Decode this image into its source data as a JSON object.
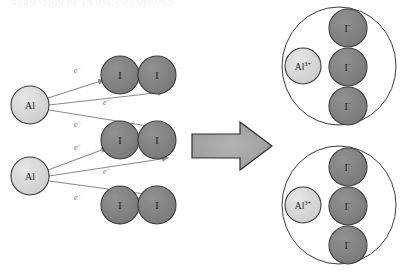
{
  "figure": {
    "title_fragment": "FORMATION OF AN IONIC COMPOUND",
    "reaction_summary": "2 Al + 3 I2 -> 2 AlI3",
    "colors": {
      "aluminum_atom_fill": "#d4d4d4",
      "aluminum_ion_fill": "#dcdcdc",
      "iodine_atom_fill": "#808080",
      "iodide_ion_fill": "#7f7f7f",
      "outline": "#3a3a3a",
      "arrow_fill": "#a8a8a8",
      "arrow_outline": "#2e2e2e",
      "electron_arrow": "#8a8a8a",
      "background": "#ffffff"
    }
  },
  "reactants": {
    "metal_atoms": [
      {
        "label": "Al",
        "cx": 30,
        "cy": 105,
        "r": 19
      },
      {
        "label": "Al",
        "cx": 30,
        "cy": 176,
        "r": 19
      }
    ],
    "halogen_molecules": [
      {
        "name": "iodine-molecule-top",
        "atoms": [
          {
            "label": "I",
            "cx": 120,
            "cy": 75,
            "r": 19
          },
          {
            "label": "I",
            "cx": 157,
            "cy": 75,
            "r": 19
          }
        ]
      },
      {
        "name": "iodine-molecule-middle",
        "atoms": [
          {
            "label": "I",
            "cx": 120,
            "cy": 140,
            "r": 19
          },
          {
            "label": "I",
            "cx": 157,
            "cy": 140,
            "r": 19
          }
        ]
      },
      {
        "name": "iodine-molecule-bottom",
        "atoms": [
          {
            "label": "I",
            "cx": 120,
            "cy": 205,
            "r": 19
          },
          {
            "label": "I",
            "cx": 157,
            "cy": 205,
            "r": 19
          }
        ]
      }
    ]
  },
  "electron_transfers": [
    {
      "label": "e",
      "charge": "−",
      "label_x": 74,
      "label_y": 73,
      "x1": 48,
      "y1": 98,
      "x2": 104,
      "y2": 80
    },
    {
      "label": "e",
      "charge": "−",
      "label_x": 103,
      "label_y": 105,
      "x1": 49,
      "y1": 105,
      "x2": 164,
      "y2": 92
    },
    {
      "label": "e",
      "charge": "−",
      "label_x": 74,
      "label_y": 127,
      "x1": 49,
      "y1": 110,
      "x2": 160,
      "y2": 128
    },
    {
      "label": "e",
      "charge": "−",
      "label_x": 74,
      "label_y": 150,
      "x1": 48,
      "y1": 170,
      "x2": 107,
      "y2": 148
    },
    {
      "label": "e",
      "charge": "−",
      "label_x": 103,
      "label_y": 174,
      "x1": 49,
      "y1": 176,
      "x2": 168,
      "y2": 158
    },
    {
      "label": "e",
      "charge": "−",
      "label_x": 74,
      "label_y": 200,
      "x1": 49,
      "y1": 181,
      "x2": 160,
      "y2": 196
    }
  ],
  "reaction_arrow": {
    "name": "reaction-arrow",
    "direction": "right",
    "x": 192,
    "y": 122,
    "width": 80,
    "height": 48
  },
  "products": [
    {
      "name": "formula-unit-top",
      "ellipse": {
        "cx": 339,
        "cy": 66,
        "rx": 57,
        "ry": 59
      },
      "cation": {
        "label": "Al",
        "charge": "3+",
        "cx": 303,
        "cy": 66,
        "r": 18
      },
      "anions": [
        {
          "label": "I",
          "charge": "−",
          "cx": 348,
          "cy": 28,
          "r": 19
        },
        {
          "label": "I",
          "charge": "−",
          "cx": 348,
          "cy": 67,
          "r": 19
        },
        {
          "label": "I",
          "charge": "−",
          "cx": 348,
          "cy": 106,
          "r": 19
        }
      ]
    },
    {
      "name": "formula-unit-bottom",
      "ellipse": {
        "cx": 339,
        "cy": 205,
        "rx": 57,
        "ry": 59
      },
      "cation": {
        "label": "Al",
        "charge": "3+",
        "cx": 303,
        "cy": 205,
        "r": 18
      },
      "anions": [
        {
          "label": "I",
          "charge": "−",
          "cx": 348,
          "cy": 167,
          "r": 19
        },
        {
          "label": "I",
          "charge": "−",
          "cx": 348,
          "cy": 206,
          "r": 19
        },
        {
          "label": "I",
          "charge": "−",
          "cx": 348,
          "cy": 245,
          "r": 19
        }
      ]
    }
  ]
}
